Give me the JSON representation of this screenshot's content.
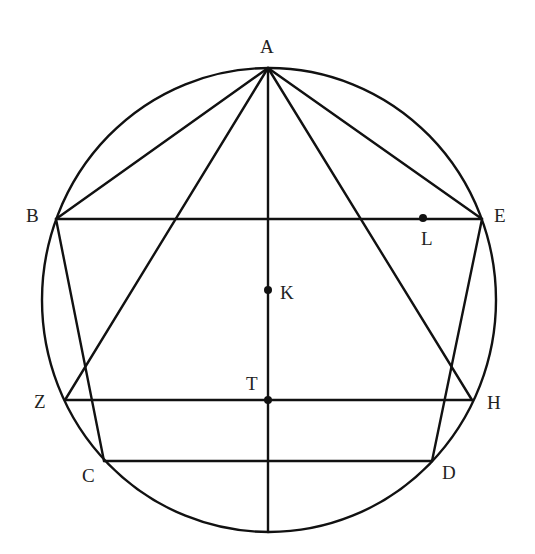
{
  "diagram": {
    "points": {
      "A": {
        "label": "A"
      },
      "B": {
        "label": "B"
      },
      "E": {
        "label": "E"
      },
      "Z": {
        "label": "Z"
      },
      "H": {
        "label": "H"
      },
      "C": {
        "label": "C"
      },
      "D": {
        "label": "D"
      },
      "K": {
        "label": "K"
      },
      "T": {
        "label": "T"
      },
      "L": {
        "label": "L"
      }
    },
    "segments": [
      [
        "A",
        "B"
      ],
      [
        "A",
        "E"
      ],
      [
        "A",
        "Z"
      ],
      [
        "A",
        "H"
      ],
      [
        "A",
        "BOTTOM"
      ],
      [
        "B",
        "E"
      ],
      [
        "Z",
        "H"
      ],
      [
        "C",
        "D"
      ],
      [
        "B",
        "C"
      ],
      [
        "E",
        "D"
      ]
    ],
    "marked_points": [
      "K",
      "T",
      "L"
    ],
    "stroke_color": "#111111"
  }
}
